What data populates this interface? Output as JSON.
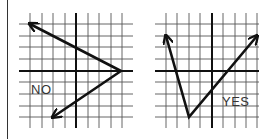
{
  "figure": {
    "grid_color": "#555555",
    "axis_color": "#111111",
    "line_color": "#111111",
    "graphs": [
      {
        "id": "left",
        "label": "NO",
        "label_pos": {
          "x": 31,
          "y": 83
        },
        "grid": {
          "x_lines": [
            30,
            42,
            53,
            65,
            76,
            88,
            99,
            111,
            122
          ],
          "y_lines": [
            24,
            36,
            47,
            59,
            71,
            82,
            94,
            106,
            117
          ],
          "x_axis_y": 71,
          "y_axis_x": 76,
          "x_min": 19,
          "x_max": 133,
          "y_min": 13,
          "y_max": 128
        },
        "path": [
          [
            30,
            24
          ],
          [
            121,
            71
          ],
          [
            53,
            117
          ]
        ],
        "arrows": [
          "start",
          "end"
        ]
      },
      {
        "id": "right",
        "label": "YES",
        "label_pos": {
          "x": 222,
          "y": 95
        },
        "grid": {
          "x_lines": [
            166,
            177,
            189,
            200,
            212,
            223,
            235,
            246,
            257
          ],
          "y_lines": [
            24,
            36,
            47,
            59,
            71,
            82,
            94,
            106,
            117
          ],
          "x_axis_y": 71,
          "y_axis_x": 212,
          "x_min": 155,
          "x_max": 259,
          "y_min": 13,
          "y_max": 128
        },
        "path": [
          [
            166,
            36
          ],
          [
            189,
            117
          ],
          [
            257,
            36
          ]
        ],
        "arrows": [
          "start",
          "end"
        ]
      }
    ]
  }
}
